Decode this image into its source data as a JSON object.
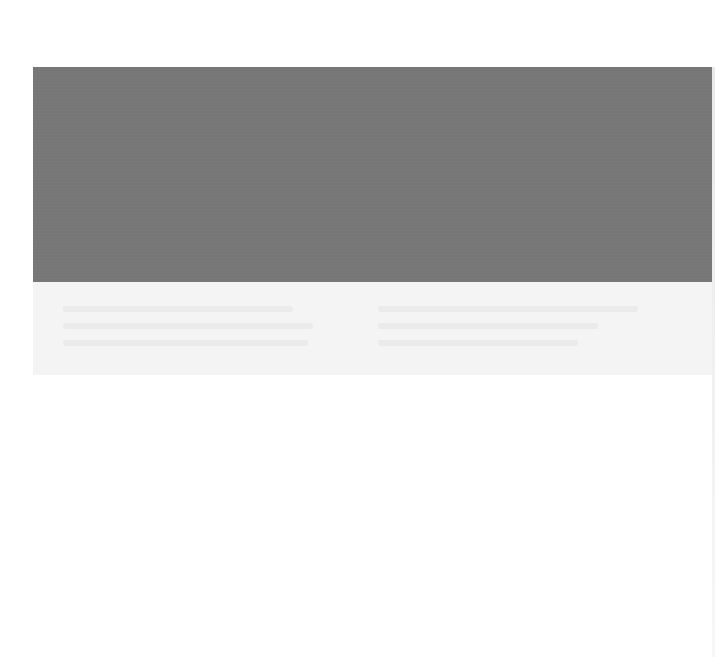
{
  "page": {
    "type": "scanned-document",
    "background_color": "#ffffff"
  },
  "image_block": {
    "description": "gray photo/image placeholder region",
    "color": "#777777"
  },
  "caption_band": {
    "color": "#f4f4f4",
    "text_legible": false,
    "left_column_lines": 3,
    "right_column_lines": 3
  }
}
